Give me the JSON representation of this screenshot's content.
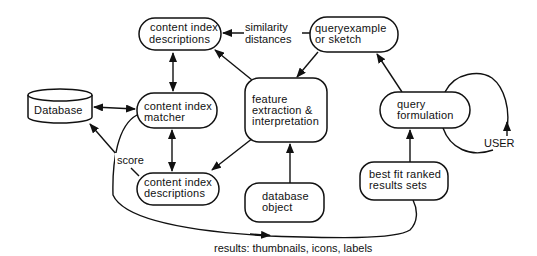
{
  "diagram": {
    "type": "flowchart",
    "colors": {
      "stroke": "#111111",
      "background": "#ffffff",
      "text": "#111111"
    },
    "nodes": {
      "cid_top": {
        "line1": "content index",
        "line2": "descriptions"
      },
      "query_example": {
        "line1": "queryexample",
        "line2": "or sketch"
      },
      "database": {
        "label": "Database"
      },
      "matcher": {
        "line1": "content index",
        "line2": "matcher"
      },
      "feature": {
        "line1": "feature",
        "line2": "extraction &",
        "line3": "interpretation"
      },
      "query_formulation": {
        "line1": "query",
        "line2": "formulation"
      },
      "cid_bottom": {
        "line1": "content index",
        "line2": "descriptions"
      },
      "db_object": {
        "line1": "database",
        "line2": "object"
      },
      "best_fit": {
        "line1": "best fit ranked",
        "line2": "results sets"
      }
    },
    "edge_labels": {
      "similarity_line1": "similarity",
      "similarity_line2": "distances",
      "score": "score",
      "user": "USER",
      "results": "results: thumbnails, icons, labels"
    }
  }
}
